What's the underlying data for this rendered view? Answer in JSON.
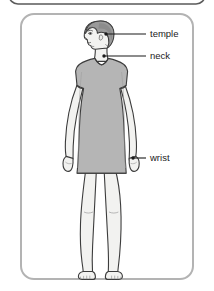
{
  "figure": {
    "title_absent": true,
    "frame": {
      "outer_partial_bar_color": "#5a5a5a",
      "panel_border_color": "#b3b3b3",
      "panel_fill_color": "#ffffff"
    },
    "colors": {
      "hair": "#9a9a9a",
      "hair_shade": "#8a8a8a",
      "skin": "#f2f2f0",
      "skin_line": "#4a4a4a",
      "dress": "#b5b5b5",
      "dress_shade": "#a8a8a8",
      "outline": "#3c3c3c",
      "leader_line": "#1b1b1b",
      "marker_dot": "#1b1b1b",
      "label_text": "#1b1b1b"
    },
    "labels": [
      {
        "id": "temple",
        "text": "temple",
        "dot_x": 106,
        "dot_y": 34,
        "line_x2": 146,
        "text_x": 150,
        "text_y": 34
      },
      {
        "id": "neck",
        "text": "neck",
        "dot_x": 104,
        "dot_y": 56,
        "line_x2": 146,
        "text_x": 150,
        "text_y": 56
      },
      {
        "id": "wrist",
        "text": "wrist",
        "dot_x": 133,
        "dot_y": 158,
        "line_x2": 146,
        "text_x": 150,
        "text_y": 158
      }
    ]
  }
}
